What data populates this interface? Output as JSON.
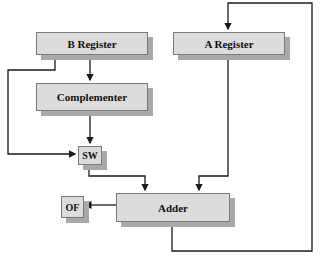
{
  "diagram": {
    "type": "block-diagram",
    "blocks": {
      "b_register": "B Register",
      "a_register": "A Register",
      "complementer": "Complementer",
      "switch": "SW",
      "adder": "Adder",
      "overflow": "OF"
    },
    "connections": [
      {
        "from": "B Register",
        "to": "Complementer"
      },
      {
        "from": "B Register",
        "to": "SW"
      },
      {
        "from": "Complementer",
        "to": "SW"
      },
      {
        "from": "SW",
        "to": "Adder"
      },
      {
        "from": "A Register",
        "to": "Adder"
      },
      {
        "from": "Adder",
        "to": "OF"
      },
      {
        "from": "Adder",
        "to": "A Register"
      }
    ],
    "colors": {
      "box_fill": "#dcdcdc",
      "box_shadow": "#a9a9a9",
      "wire": "#1a1a1a"
    }
  }
}
